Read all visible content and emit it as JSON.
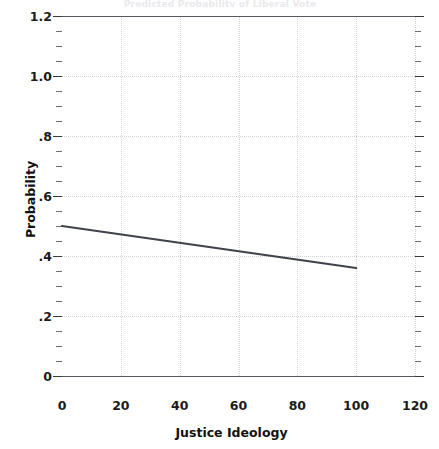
{
  "title_remnant": "Predicted Probability of Liberal Vote",
  "axes": {
    "y_title": "Probability",
    "x_title": "Justice Ideology"
  },
  "ticks": {
    "y_labels": [
      "1.2",
      "1.0",
      ".8",
      ".6",
      ".4",
      ".2",
      "0"
    ],
    "y_values": [
      1.2,
      1.0,
      0.8,
      0.6,
      0.4,
      0.2,
      0
    ],
    "x_labels": [
      "0",
      "20",
      "40",
      "60",
      "80",
      "100",
      "120"
    ],
    "x_values": [
      0,
      20,
      40,
      60,
      80,
      100,
      120
    ]
  },
  "colors": {
    "line": "#3f4349",
    "frame": "#555a60",
    "grid": "#d3d3d8",
    "tick": "#3a3a3a",
    "text": "#1b1b1b",
    "background": "#ffffff"
  },
  "chart_data": {
    "type": "line",
    "title": "Predicted Probability of Liberal Vote",
    "xlabel": "Justice Ideology",
    "ylabel": "Probability",
    "xlim": [
      0,
      120
    ],
    "ylim": [
      0,
      1.2
    ],
    "grid": true,
    "legend": "none",
    "xticks": [
      0,
      20,
      40,
      60,
      80,
      100,
      120
    ],
    "yticks": [
      0,
      0.2,
      0.4,
      0.6,
      0.8,
      1.0,
      1.2
    ],
    "ytick_labels": [
      "0",
      ".2",
      ".4",
      ".6",
      ".8",
      "1.0",
      "1.2"
    ],
    "minor_ticks": true,
    "series": [
      {
        "name": "Predicted probability",
        "x": [
          0,
          100
        ],
        "y": [
          0.5,
          0.36
        ],
        "color": "#3f4349",
        "width": 2.2
      }
    ],
    "annotations": []
  }
}
